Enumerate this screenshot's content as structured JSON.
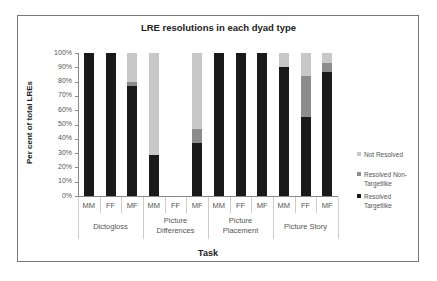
{
  "chart_data": {
    "type": "bar",
    "stacked": true,
    "percent_stacked": true,
    "title": "LRE resolutions in each dyad type",
    "xlabel": "Task",
    "ylabel": "Per cent of total LREs",
    "ylim": [
      0,
      100
    ],
    "yticks": [
      "0%",
      "10%",
      "20%",
      "30%",
      "40%",
      "50%",
      "60%",
      "70%",
      "80%",
      "90%",
      "100%"
    ],
    "groups": [
      "Dictogloss",
      "Picture Differences",
      "Picture Placement",
      "Picture Story"
    ],
    "categories": [
      "MM",
      "FF",
      "MF",
      "MM",
      "FF",
      "MF",
      "MM",
      "FF",
      "MF",
      "MM",
      "FF",
      "MF"
    ],
    "series": [
      {
        "name": "Resolved Targetlike",
        "color": "#1a1a1a",
        "values": [
          100,
          100,
          77,
          29,
          0,
          37,
          100,
          100,
          100,
          90,
          55,
          87
        ]
      },
      {
        "name": "Resolved Non-Targetlike",
        "color": "#8c8c8c",
        "values": [
          0,
          0,
          3,
          0,
          0,
          10,
          0,
          0,
          0,
          0,
          29,
          6
        ]
      },
      {
        "name": "Not Resolved",
        "color": "#c8c8c8",
        "values": [
          0,
          0,
          20,
          71,
          0,
          53,
          0,
          0,
          0,
          10,
          16,
          7
        ]
      }
    ],
    "legend": {
      "position": "right",
      "order": [
        "Not Resolved",
        "Resolved Non-Targetlike",
        "Resolved Targetlike"
      ]
    },
    "grid": false
  },
  "labels": {
    "title": "LRE resolutions in each dyad type",
    "xlabel": "Task",
    "ylabel": "Per cent of total LREs",
    "groups": {
      "g0": "Dictogloss",
      "g1a": "Picture",
      "g1b": "Differences",
      "g2a": "Picture",
      "g2b": "Placement",
      "g3": "Picture Story"
    },
    "legend": {
      "not_resolved": "Not Resolved",
      "nontarget_a": "Resolved Non-",
      "nontarget_b": "Targetlike",
      "target_a": "Resolved",
      "target_b": "Targetlike"
    }
  }
}
